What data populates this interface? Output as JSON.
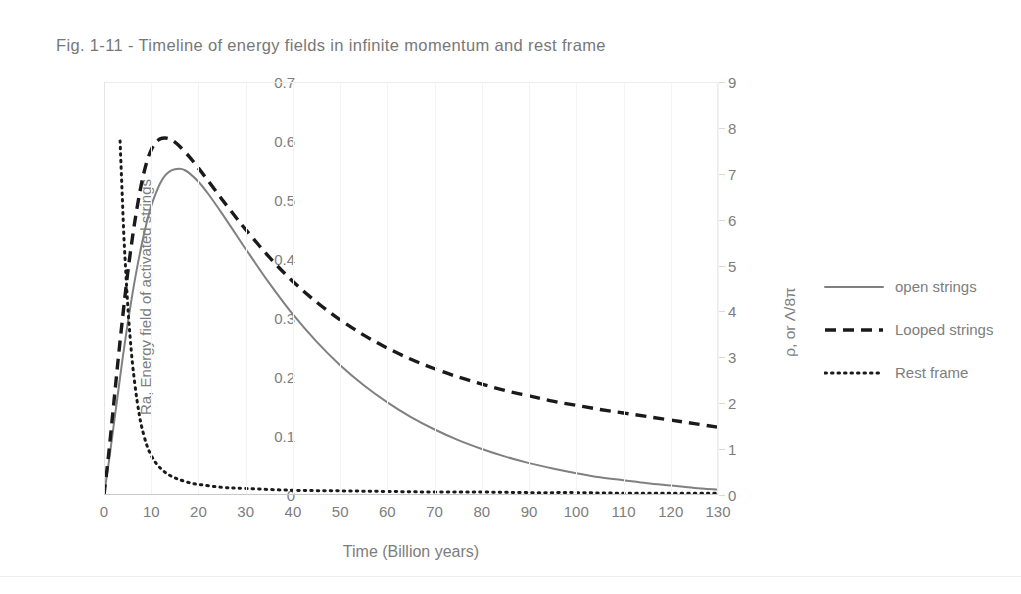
{
  "figure": {
    "title": "Fig. 1-11 - Timeline of energy fields in infinite momentum and rest frame"
  },
  "colors": {
    "open_strings": "#808080",
    "looped_strings": "#1a1a1a",
    "rest_frame": "#1a1a1a",
    "text": "#7d7d7d",
    "grid": "#f3f3f3",
    "axis": "#c9c9c9",
    "background": "#ffffff"
  },
  "legend": {
    "position": "right",
    "entries": [
      {
        "label": "open strings",
        "style": "solid"
      },
      {
        "label": "Looped strings",
        "style": "dashed"
      },
      {
        "label": "Rest frame",
        "style": "dotted"
      }
    ]
  },
  "chart_data": {
    "type": "line",
    "title": "Fig. 1-11 - Timeline of energy fields in infinite momentum and rest frame",
    "xlabel": "Time (Billion years)",
    "ylabel": "Ra, Energy field of activated strings",
    "y2label": "ρ, or Λ/8π",
    "xlim": [
      0,
      130
    ],
    "ylim": [
      0,
      0.7
    ],
    "y2lim": [
      0,
      9
    ],
    "xticks": [
      0,
      10,
      20,
      30,
      40,
      50,
      60,
      70,
      80,
      90,
      100,
      110,
      120,
      130
    ],
    "yticks": [
      "0",
      "0.1",
      "0.2",
      "0.3",
      "0.4",
      "0.5",
      "0.6",
      "0.7"
    ],
    "y2ticks": [
      "0",
      "1",
      "2",
      "3",
      "4",
      "5",
      "6",
      "7",
      "8",
      "9"
    ],
    "grid": "vertical-faint",
    "series": [
      {
        "name": "open strings",
        "style": "solid",
        "color": "#808080",
        "axis": "left",
        "x": [
          0,
          1,
          2,
          3,
          4,
          5,
          6,
          7,
          8,
          9,
          10,
          11,
          12,
          13,
          14,
          15,
          16,
          17,
          18,
          20,
          22,
          25,
          28,
          30,
          35,
          40,
          45,
          50,
          55,
          60,
          65,
          70,
          75,
          80,
          85,
          90,
          95,
          100,
          105,
          110,
          115,
          120,
          125,
          130
        ],
        "y": [
          0,
          0.055,
          0.115,
          0.175,
          0.235,
          0.29,
          0.34,
          0.385,
          0.425,
          0.46,
          0.49,
          0.512,
          0.53,
          0.542,
          0.549,
          0.552,
          0.553,
          0.551,
          0.546,
          0.531,
          0.511,
          0.477,
          0.441,
          0.417,
          0.359,
          0.306,
          0.26,
          0.22,
          0.186,
          0.157,
          0.132,
          0.111,
          0.093,
          0.078,
          0.065,
          0.054,
          0.045,
          0.037,
          0.03,
          0.025,
          0.02,
          0.016,
          0.012,
          0.009
        ]
      },
      {
        "name": "Looped strings",
        "style": "dashed",
        "color": "#1a1a1a",
        "axis": "left",
        "x": [
          0,
          1,
          2,
          3,
          4,
          5,
          6,
          7,
          8,
          9,
          10,
          11,
          12,
          13,
          14,
          15,
          16,
          18,
          20,
          22,
          25,
          28,
          30,
          35,
          40,
          45,
          50,
          55,
          60,
          65,
          70,
          75,
          80,
          85,
          90,
          95,
          100,
          105,
          110,
          115,
          120,
          125,
          130
        ],
        "y": [
          0,
          0.07,
          0.15,
          0.23,
          0.305,
          0.375,
          0.435,
          0.487,
          0.53,
          0.563,
          0.585,
          0.598,
          0.604,
          0.605,
          0.603,
          0.598,
          0.591,
          0.574,
          0.554,
          0.533,
          0.501,
          0.47,
          0.45,
          0.403,
          0.362,
          0.327,
          0.297,
          0.271,
          0.249,
          0.23,
          0.214,
          0.2,
          0.188,
          0.177,
          0.168,
          0.159,
          0.152,
          0.145,
          0.139,
          0.133,
          0.127,
          0.121,
          0.115
        ]
      },
      {
        "name": "Rest frame",
        "style": "dotted",
        "color": "#1a1a1a",
        "axis": "left",
        "x": [
          3.4,
          3.6,
          3.9,
          4.2,
          4.6,
          5,
          5.5,
          6,
          6.5,
          7,
          7.5,
          8,
          9,
          10,
          11,
          12,
          13,
          14,
          15,
          16,
          18,
          20,
          25,
          30,
          40,
          50,
          60,
          70,
          80,
          90,
          100,
          110,
          120,
          130
        ],
        "y": [
          0.6,
          0.56,
          0.5,
          0.44,
          0.38,
          0.325,
          0.27,
          0.225,
          0.19,
          0.16,
          0.135,
          0.115,
          0.086,
          0.067,
          0.054,
          0.045,
          0.038,
          0.033,
          0.029,
          0.026,
          0.021,
          0.018,
          0.013,
          0.011,
          0.008,
          0.007,
          0.006,
          0.005,
          0.005,
          0.004,
          0.004,
          0.003,
          0.003,
          0.003
        ]
      }
    ]
  }
}
